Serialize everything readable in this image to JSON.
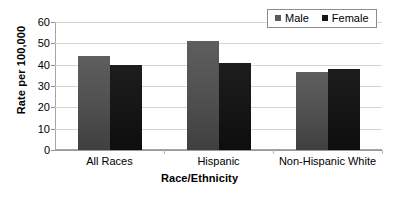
{
  "chart_data": {
    "type": "bar",
    "title": "",
    "xlabel": "Race/Ethnicity",
    "ylabel": "Rate per 100,000",
    "categories": [
      "All Races",
      "Hispanic",
      "Non-Hispanic White"
    ],
    "series": [
      {
        "name": "Male",
        "color": "#595959",
        "values": [
          44,
          51,
          36.5
        ]
      },
      {
        "name": "Female",
        "color": "#1a1a1a",
        "values": [
          40,
          41,
          38
        ]
      }
    ],
    "ylim": [
      0,
      60
    ],
    "yticks": [
      0,
      10,
      20,
      30,
      40,
      50,
      60
    ],
    "ytick_labels": [
      "0",
      "10",
      "20",
      "30",
      "40",
      "50",
      "60"
    ],
    "grid": true,
    "legend_position": "top-right"
  },
  "legend": {
    "items": [
      {
        "label": "Male",
        "swatch": "male-swatch"
      },
      {
        "label": "Female",
        "swatch": "female-swatch"
      }
    ]
  }
}
